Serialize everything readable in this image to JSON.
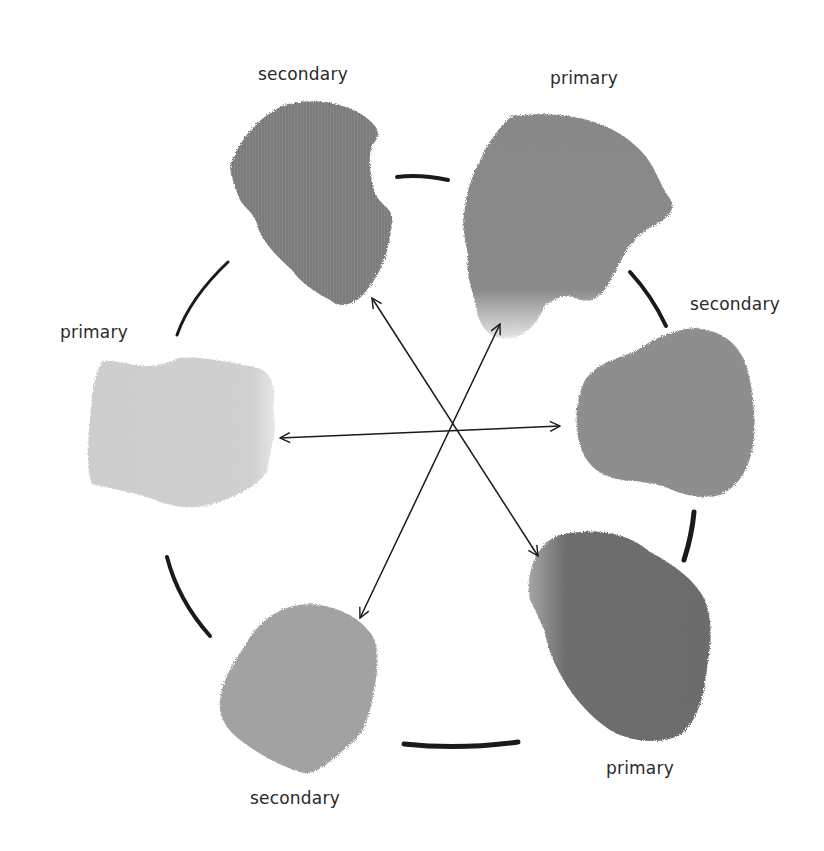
{
  "diagram": {
    "title": "",
    "type": "color-wheel",
    "labels": {
      "top_left": "secondary",
      "top_right": "primary",
      "right_upper": "secondary",
      "left": "primary",
      "bottom_right": "primary",
      "bottom_left": "secondary"
    },
    "swatches": [
      {
        "id": "top-left",
        "role": "secondary",
        "color": "#7c7c7c",
        "label_pos": [
          258,
          64
        ]
      },
      {
        "id": "top-right",
        "role": "primary",
        "color": "#8a8a8a",
        "label_pos": [
          550,
          68
        ]
      },
      {
        "id": "right-upper",
        "role": "secondary",
        "color": "#8e8e8e",
        "label_pos": [
          690,
          296
        ]
      },
      {
        "id": "left",
        "role": "primary",
        "color": "#cfcfcf",
        "label_pos": [
          60,
          324
        ]
      },
      {
        "id": "bottom-right",
        "role": "primary",
        "color": "#6e6e6e",
        "label_pos": [
          606,
          760
        ]
      },
      {
        "id": "bottom-left",
        "role": "secondary",
        "color": "#a2a2a2",
        "label_pos": [
          250,
          790
        ]
      }
    ],
    "complementary_arrows": [
      {
        "from": "top-left",
        "to": "bottom-right"
      },
      {
        "from": "top-right",
        "to": "bottom-left"
      },
      {
        "from": "left",
        "to": "right-upper"
      }
    ],
    "center": [
      456,
      430
    ],
    "stroke_color": "#1a1a1a"
  }
}
